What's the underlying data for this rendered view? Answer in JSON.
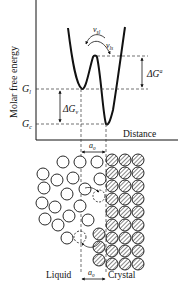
{
  "diagram": {
    "energy_plot": {
      "y_axis_label": "Molar free energy",
      "x_axis_label": "Distance",
      "levels": {
        "liquid": "G",
        "liquid_sub": "l",
        "crystal": "G",
        "crystal_sub": "c"
      },
      "annotations": {
        "activation_energy": "ΔG",
        "activation_sup": "a",
        "free_energy_difference": "ΔG",
        "free_energy_difference_sub": "v",
        "jump_freq_sl": "ν",
        "jump_freq_sl_sub": "sl",
        "jump_freq_ls": "ν",
        "jump_freq_ls_sub": "ls",
        "distance_a0": "a",
        "distance_a0_sub": "0"
      }
    },
    "atom_schematic": {
      "left_label": "Liquid",
      "right_label": "Crystal",
      "distance_label": "a",
      "distance_label_sub": "0"
    }
  }
}
